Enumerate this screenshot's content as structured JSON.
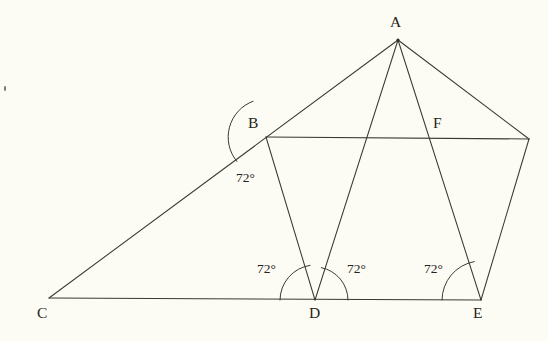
{
  "figure": {
    "background_color": "#fdfcf4",
    "stroke_color": "#3a3a32",
    "text_color": "#242420",
    "vertices": [
      {
        "id": "A",
        "label": "A",
        "x": 398,
        "y": 40,
        "label_x": 390,
        "label_y": 14
      },
      {
        "id": "B",
        "label": "B",
        "x": 266,
        "y": 137,
        "label_x": 248,
        "label_y": 115
      },
      {
        "id": "C",
        "label": "C",
        "x": 49,
        "y": 298,
        "label_x": 37,
        "label_y": 305
      },
      {
        "id": "D",
        "label": "D",
        "x": 315,
        "y": 300,
        "label_x": 309,
        "label_y": 305
      },
      {
        "id": "E",
        "label": "E",
        "x": 481,
        "y": 300,
        "label_x": 473,
        "label_y": 305
      },
      {
        "id": "F",
        "label": "F",
        "x": 430,
        "y": 137,
        "label_x": 433,
        "label_y": 115
      },
      {
        "id": "G",
        "label": "",
        "x": 529,
        "y": 139,
        "label_x": 0,
        "label_y": 0
      }
    ],
    "segments": [
      {
        "name": "segment-C-A",
        "from": "C",
        "to": "A"
      },
      {
        "name": "segment-C-E",
        "from": "C",
        "to": "E"
      },
      {
        "name": "segment-B-G",
        "from": "B",
        "to": "G"
      },
      {
        "name": "segment-B-D",
        "from": "B",
        "to": "D"
      },
      {
        "name": "segment-A-D",
        "from": "A",
        "to": "D"
      },
      {
        "name": "segment-A-E",
        "from": "A",
        "to": "E"
      },
      {
        "name": "segment-A-G",
        "from": "A",
        "to": "G"
      },
      {
        "name": "segment-E-G",
        "from": "E",
        "to": "G"
      }
    ],
    "angles": [
      {
        "id": "angle-B",
        "value": "72°",
        "vertex": "B",
        "label_x": 236,
        "label_y": 171,
        "arc": {
          "cx": 266,
          "cy": 137,
          "r": 38,
          "start_deg": 140,
          "end_deg": 250
        }
      },
      {
        "id": "angle-D-left",
        "value": "72°",
        "vertex": "D",
        "label_x": 257,
        "label_y": 262,
        "arc": {
          "cx": 315,
          "cy": 300,
          "r": 35,
          "start_deg": 180,
          "end_deg": 262
        }
      },
      {
        "id": "angle-D-right",
        "value": "72°",
        "vertex": "D",
        "label_x": 347,
        "label_y": 262,
        "arc": {
          "cx": 315,
          "cy": 300,
          "r": 33,
          "start_deg": 281,
          "end_deg": 360
        }
      },
      {
        "id": "angle-E",
        "value": "72°",
        "vertex": "E",
        "label_x": 424,
        "label_y": 262,
        "arc": {
          "cx": 481,
          "cy": 300,
          "r": 39,
          "start_deg": 180,
          "end_deg": 260
        }
      }
    ],
    "marks": [
      {
        "name": "stray-speck",
        "x": 4,
        "y": 86
      }
    ]
  }
}
